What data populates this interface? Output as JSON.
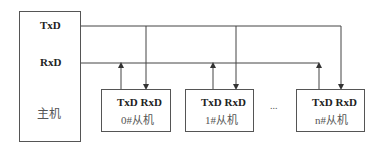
{
  "master": {
    "txd_label": "TxD",
    "rxd_label": "RxD",
    "name": "主机"
  },
  "slaves": [
    {
      "pins": "TxD RxD",
      "name": "0#从机"
    },
    {
      "pins": "TxD RxD",
      "name": "1#从机"
    },
    {
      "pins": "TxD RxD",
      "name": "n#从机"
    }
  ],
  "ellipsis": "...",
  "colors": {
    "line": "#444444",
    "box_border": "#555555"
  }
}
